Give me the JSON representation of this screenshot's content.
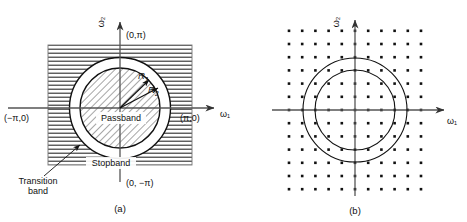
{
  "figure": {
    "panels": [
      {
        "id": "a",
        "caption": "(a)",
        "axes": {
          "x_label": "ω₁",
          "y_label": "ω₂",
          "top_point": "(0,π)",
          "bottom_point": "(0, −π)",
          "left_point": "(−π,0)",
          "right_point": "(π,0)"
        },
        "regions": [
          {
            "name": "Passband",
            "label": "Passband",
            "fill": "diagonal-hatch"
          },
          {
            "name": "Stopband",
            "label": "Stopband",
            "fill": "horizontal-hatch"
          },
          {
            "name": "Transition",
            "label": "Transition\nband",
            "label_line1": "Transition",
            "label_line2": "band",
            "fill": "white"
          }
        ],
        "radii": [
          {
            "name": "R1",
            "base": "R",
            "sub": "1"
          },
          {
            "name": "R2",
            "base": "R",
            "sub": "2"
          }
        ]
      },
      {
        "id": "b",
        "caption": "(b)",
        "axes": {
          "x_label": "ω₁",
          "y_label": "ω₂"
        },
        "grid": {
          "columns": 11,
          "rows": 13,
          "description": "sampling-grid-of-dots"
        },
        "circles": [
          {
            "name": "outer-circle"
          },
          {
            "name": "inner-circle"
          }
        ]
      }
    ],
    "colors": {
      "ink": "#111111",
      "axis": "#555555",
      "hatch": "#2a2a2a",
      "background": "#ffffff"
    }
  }
}
